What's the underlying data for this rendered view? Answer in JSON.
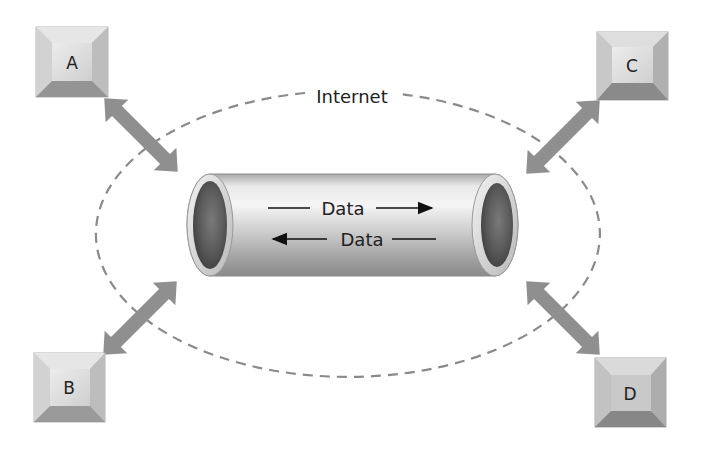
{
  "diagram": {
    "type": "network-tunnel",
    "cloud_label": "Internet",
    "pipe": {
      "forward_label": "Data",
      "reverse_label": "Data"
    },
    "nodes": [
      {
        "id": "A",
        "label": "A",
        "position": "top-left"
      },
      {
        "id": "B",
        "label": "B",
        "position": "bottom-left"
      },
      {
        "id": "C",
        "label": "C",
        "position": "top-right"
      },
      {
        "id": "D",
        "label": "D",
        "position": "bottom-right"
      }
    ],
    "connections": [
      {
        "from": "A",
        "to": "pipe",
        "style": "double-arrow"
      },
      {
        "from": "B",
        "to": "pipe",
        "style": "double-arrow"
      },
      {
        "from": "C",
        "to": "pipe",
        "style": "double-arrow"
      },
      {
        "from": "D",
        "to": "pipe",
        "style": "double-arrow"
      }
    ]
  },
  "colors": {
    "background": "#ffffff",
    "arrow": "#8f8f8f",
    "dashed_ellipse": "#8a8a8a",
    "box_face": "#d6d6d6",
    "box_top_bevel": "#e8e8e8",
    "box_bottom_bevel": "#8c8c8c",
    "pipe_light": "#f2f2f2",
    "pipe_dark": "#8a8a8a",
    "text": "#222222"
  }
}
